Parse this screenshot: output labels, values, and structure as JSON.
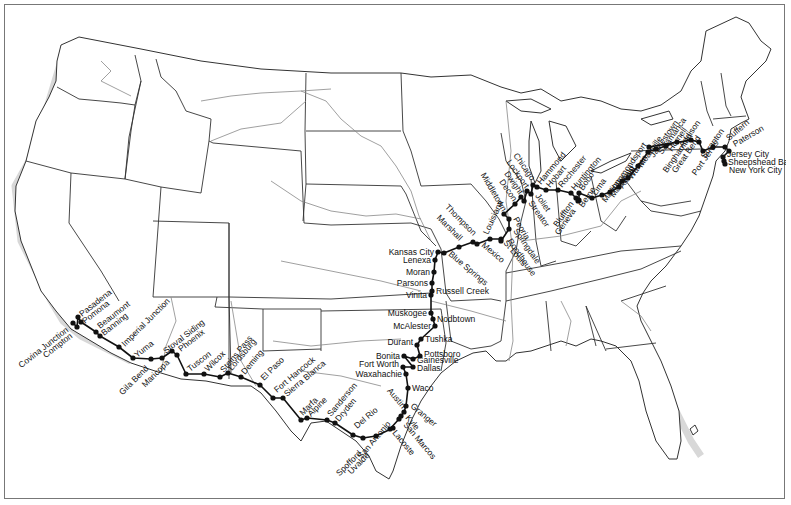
{
  "map": {
    "title": "United States rail route map",
    "colors": {
      "route": "#111111",
      "state_border": "#333333",
      "river": "#888888",
      "frame": "#777777"
    }
  },
  "stations": [
    {
      "name": "Covina Junction",
      "x": 72,
      "y": 322,
      "angle": -38,
      "anchor": "end",
      "dx": -4,
      "dy": 8
    },
    {
      "name": "Compton",
      "x": 76,
      "y": 326,
      "angle": -38,
      "anchor": "end",
      "dx": -4,
      "dy": 10
    },
    {
      "name": "Pasadena",
      "x": 77,
      "y": 316,
      "angle": -38,
      "anchor": "start",
      "dx": 4,
      "dy": 0
    },
    {
      "name": "Pomona",
      "x": 80,
      "y": 321,
      "angle": -38,
      "anchor": "start",
      "dx": 4,
      "dy": 2
    },
    {
      "name": "Beaumont",
      "x": 95,
      "y": 331,
      "angle": -38,
      "anchor": "start",
      "dx": 4,
      "dy": -3
    },
    {
      "name": "Banning",
      "x": 99,
      "y": 335,
      "angle": -38,
      "anchor": "start",
      "dx": 4,
      "dy": 0
    },
    {
      "name": "Imperial Junction",
      "x": 118,
      "y": 346,
      "angle": -45,
      "anchor": "start",
      "dx": 6,
      "dy": 0
    },
    {
      "name": "Yuma",
      "x": 132,
      "y": 357,
      "angle": -38,
      "anchor": "start",
      "dx": 4,
      "dy": 0
    },
    {
      "name": "Gila Bend",
      "x": 150,
      "y": 358,
      "angle": -45,
      "anchor": "end",
      "dx": -2,
      "dy": 10
    },
    {
      "name": "Stoval Siding",
      "x": 161,
      "y": 357,
      "angle": -38,
      "anchor": "start",
      "dx": 4,
      "dy": -4
    },
    {
      "name": "Maricopa",
      "x": 171,
      "y": 350,
      "angle": -45,
      "anchor": "end",
      "dx": -2,
      "dy": 12
    },
    {
      "name": "Phoenix",
      "x": 176,
      "y": 354,
      "angle": -38,
      "anchor": "start",
      "dx": 4,
      "dy": -3
    },
    {
      "name": "Tuscon",
      "x": 185,
      "y": 373,
      "angle": -38,
      "anchor": "start",
      "dx": 4,
      "dy": -2
    },
    {
      "name": "Wilcox",
      "x": 203,
      "y": 373,
      "angle": -45,
      "anchor": "start",
      "dx": 4,
      "dy": -2
    },
    {
      "name": "Steins Pass",
      "x": 219,
      "y": 376,
      "angle": -50,
      "anchor": "start",
      "dx": 4,
      "dy": -4
    },
    {
      "name": "Lordsburg",
      "x": 227,
      "y": 372,
      "angle": -50,
      "anchor": "start",
      "dx": 4,
      "dy": -2
    },
    {
      "name": "Deming",
      "x": 240,
      "y": 376,
      "angle": -50,
      "anchor": "start",
      "dx": 4,
      "dy": -2
    },
    {
      "name": "El Paso",
      "x": 259,
      "y": 384,
      "angle": -45,
      "anchor": "start",
      "dx": 4,
      "dy": -4
    },
    {
      "name": "Fort Hancock",
      "x": 272,
      "y": 397,
      "angle": -40,
      "anchor": "start",
      "dx": 4,
      "dy": -5
    },
    {
      "name": "Sierra Blanca",
      "x": 282,
      "y": 397,
      "angle": -40,
      "anchor": "start",
      "dx": 4,
      "dy": -1
    },
    {
      "name": "Marfa",
      "x": 300,
      "y": 419,
      "angle": -45,
      "anchor": "start",
      "dx": 2,
      "dy": -4
    },
    {
      "name": "Alpine",
      "x": 306,
      "y": 417,
      "angle": -45,
      "anchor": "start",
      "dx": 4,
      "dy": -1
    },
    {
      "name": "Sanderson",
      "x": 326,
      "y": 419,
      "angle": -50,
      "anchor": "start",
      "dx": 4,
      "dy": -3
    },
    {
      "name": "Dryden",
      "x": 334,
      "y": 422,
      "angle": -50,
      "anchor": "start",
      "dx": 4,
      "dy": -1
    },
    {
      "name": "Del Rio",
      "x": 352,
      "y": 434,
      "angle": -40,
      "anchor": "start",
      "dx": 4,
      "dy": -6
    },
    {
      "name": "Spofford",
      "x": 362,
      "y": 437,
      "angle": -45,
      "anchor": "end",
      "dx": -1,
      "dy": 16
    },
    {
      "name": "Uvalde",
      "x": 375,
      "y": 435,
      "angle": -45,
      "anchor": "end",
      "dx": -6,
      "dy": 20
    },
    {
      "name": "San Antonio",
      "x": 392,
      "y": 427,
      "angle": -50,
      "anchor": "end",
      "dx": -2,
      "dy": -4
    },
    {
      "name": "Lacoste",
      "x": 389,
      "y": 428,
      "angle": 50,
      "anchor": "start",
      "dx": 2,
      "dy": 4
    },
    {
      "name": "San Marcos",
      "x": 398,
      "y": 418,
      "angle": 50,
      "anchor": "start",
      "dx": 4,
      "dy": 6
    },
    {
      "name": "Kyle",
      "x": 400,
      "y": 415,
      "angle": 50,
      "anchor": "start",
      "dx": 4,
      "dy": 2
    },
    {
      "name": "Austin",
      "x": 403,
      "y": 411,
      "angle": 50,
      "anchor": "end",
      "dx": -2,
      "dy": -3
    },
    {
      "name": "Granger",
      "x": 405,
      "y": 405,
      "angle": 40,
      "anchor": "start",
      "dx": 4,
      "dy": 1
    },
    {
      "name": "Waco",
      "x": 407,
      "y": 387,
      "angle": 0,
      "anchor": "start",
      "dx": 4,
      "dy": 3
    },
    {
      "name": "Waxahachie",
      "x": 405,
      "y": 373,
      "angle": 0,
      "anchor": "end",
      "dx": -4,
      "dy": 3
    },
    {
      "name": "Fort Worth",
      "x": 402,
      "y": 366,
      "angle": 0,
      "anchor": "end",
      "dx": -4,
      "dy": 0
    },
    {
      "name": "Dallas",
      "x": 412,
      "y": 366,
      "angle": 0,
      "anchor": "start",
      "dx": 4,
      "dy": 4
    },
    {
      "name": "Bonita",
      "x": 403,
      "y": 355,
      "angle": 0,
      "anchor": "end",
      "dx": -4,
      "dy": 3
    },
    {
      "name": "Gainesville",
      "x": 412,
      "y": 358,
      "angle": 0,
      "anchor": "start",
      "dx": 4,
      "dy": 4
    },
    {
      "name": "Pottsboro",
      "x": 419,
      "y": 355,
      "angle": 0,
      "anchor": "start",
      "dx": 4,
      "dy": 1
    },
    {
      "name": "Durant",
      "x": 416,
      "y": 344,
      "angle": 0,
      "anchor": "end",
      "dx": -4,
      "dy": 0
    },
    {
      "name": "Tushka",
      "x": 420,
      "y": 338,
      "angle": 0,
      "anchor": "start",
      "dx": 4,
      "dy": 3
    },
    {
      "name": "McAlester",
      "x": 434,
      "y": 325,
      "angle": 0,
      "anchor": "end",
      "dx": -4,
      "dy": 3
    },
    {
      "name": "Nodbtown",
      "x": 432,
      "y": 318,
      "angle": 0,
      "anchor": "start",
      "dx": 4,
      "dy": 3
    },
    {
      "name": "Muskogee",
      "x": 430,
      "y": 312,
      "angle": 0,
      "anchor": "end",
      "dx": -4,
      "dy": 3
    },
    {
      "name": "Vinita",
      "x": 430,
      "y": 294,
      "angle": 0,
      "anchor": "end",
      "dx": -4,
      "dy": 3
    },
    {
      "name": "Russell Creek",
      "x": 431,
      "y": 290,
      "angle": 0,
      "anchor": "start",
      "dx": 4,
      "dy": 3
    },
    {
      "name": "Parsons",
      "x": 431,
      "y": 282,
      "angle": 0,
      "anchor": "end",
      "dx": -4,
      "dy": 3
    },
    {
      "name": "Moran",
      "x": 433,
      "y": 271,
      "angle": 0,
      "anchor": "end",
      "dx": -4,
      "dy": 3
    },
    {
      "name": "Lenexa",
      "x": 434,
      "y": 259,
      "angle": 0,
      "anchor": "end",
      "dx": -4,
      "dy": 3
    },
    {
      "name": "Kansas City",
      "x": 437,
      "y": 251,
      "angle": 0,
      "anchor": "end",
      "dx": -4,
      "dy": 3
    },
    {
      "name": "Blue Springs",
      "x": 443,
      "y": 252,
      "angle": 40,
      "anchor": "start",
      "dx": 4,
      "dy": 2
    },
    {
      "name": "Marshall",
      "x": 458,
      "y": 246,
      "angle": 45,
      "anchor": "end",
      "dx": 0,
      "dy": -6
    },
    {
      "name": "Thompson",
      "x": 472,
      "y": 241,
      "angle": 45,
      "anchor": "end",
      "dx": 0,
      "dy": -6
    },
    {
      "name": "Mexico",
      "x": 476,
      "y": 243,
      "angle": 40,
      "anchor": "start",
      "dx": 4,
      "dy": 2
    },
    {
      "name": "Louisiana",
      "x": 489,
      "y": 238,
      "angle": -65,
      "anchor": "start",
      "dx": -2,
      "dy": -4
    },
    {
      "name": "St Louis",
      "x": 500,
      "y": 238,
      "angle": 50,
      "anchor": "start",
      "dx": 2,
      "dy": 4
    },
    {
      "name": "Roodhouse",
      "x": 500,
      "y": 240,
      "angle": 55,
      "anchor": "start",
      "dx": 6,
      "dy": 0
    },
    {
      "name": "Springdale",
      "x": 508,
      "y": 228,
      "angle": 55,
      "anchor": "start",
      "dx": 4,
      "dy": 2
    },
    {
      "name": "Peoria",
      "x": 508,
      "y": 218,
      "angle": 60,
      "anchor": "start",
      "dx": 4,
      "dy": 0
    },
    {
      "name": "Middletown",
      "x": 503,
      "y": 213,
      "angle": 60,
      "anchor": "end",
      "dx": -2,
      "dy": -2
    },
    {
      "name": "Decon",
      "x": 514,
      "y": 203,
      "angle": 55,
      "anchor": "end",
      "dx": -2,
      "dy": -2
    },
    {
      "name": "Dwight",
      "x": 520,
      "y": 196,
      "angle": 55,
      "anchor": "end",
      "dx": -2,
      "dy": -2
    },
    {
      "name": "Streator",
      "x": 523,
      "y": 200,
      "angle": 55,
      "anchor": "start",
      "dx": 4,
      "dy": 2
    },
    {
      "name": "Lockport",
      "x": 526,
      "y": 190,
      "angle": 55,
      "anchor": "end",
      "dx": -2,
      "dy": -2
    },
    {
      "name": "Joliet",
      "x": 530,
      "y": 193,
      "angle": 55,
      "anchor": "start",
      "dx": 4,
      "dy": 2
    },
    {
      "name": "Chicago",
      "x": 532,
      "y": 184,
      "angle": 55,
      "anchor": "end",
      "dx": -2,
      "dy": -4
    },
    {
      "name": "Hammond",
      "x": 536,
      "y": 186,
      "angle": -50,
      "anchor": "start",
      "dx": 4,
      "dy": -2
    },
    {
      "name": "Hobart",
      "x": 545,
      "y": 189,
      "angle": -50,
      "anchor": "start",
      "dx": 4,
      "dy": -2
    },
    {
      "name": "Rochester",
      "x": 557,
      "y": 189,
      "angle": -50,
      "anchor": "start",
      "dx": 4,
      "dy": -2
    },
    {
      "name": "Huntington",
      "x": 570,
      "y": 192,
      "angle": -50,
      "anchor": "start",
      "dx": 4,
      "dy": -2
    },
    {
      "name": "Bluffton",
      "x": 575,
      "y": 197,
      "angle": -55,
      "anchor": "end",
      "dx": -2,
      "dy": 6
    },
    {
      "name": "Geneva",
      "x": 577,
      "y": 200,
      "angle": -55,
      "anchor": "end",
      "dx": -2,
      "dy": 10
    },
    {
      "name": "Berne",
      "x": 578,
      "y": 199,
      "angle": -55,
      "anchor": "start",
      "dx": 4,
      "dy": 8
    },
    {
      "name": "Bobo",
      "x": 578,
      "y": 192,
      "angle": -55,
      "anchor": "start",
      "dx": 4,
      "dy": -2
    },
    {
      "name": "Lima",
      "x": 591,
      "y": 197,
      "angle": -55,
      "anchor": "start",
      "dx": 4,
      "dy": -2
    },
    {
      "name": "Marion",
      "x": 601,
      "y": 194,
      "angle": -55,
      "anchor": "start",
      "dx": 4,
      "dy": 8
    },
    {
      "name": "Mansfield",
      "x": 609,
      "y": 191,
      "angle": -55,
      "anchor": "start",
      "dx": 4,
      "dy": 6
    },
    {
      "name": "Akron",
      "x": 618,
      "y": 186,
      "angle": -55,
      "anchor": "start",
      "dx": 4,
      "dy": 2
    },
    {
      "name": "Kent",
      "x": 621,
      "y": 180,
      "angle": -55,
      "anchor": "start",
      "dx": 4,
      "dy": 2
    },
    {
      "name": "Warren",
      "x": 627,
      "y": 177,
      "angle": -55,
      "anchor": "start",
      "dx": 4,
      "dy": 2
    },
    {
      "name": "Meadville",
      "x": 637,
      "y": 165,
      "angle": -55,
      "anchor": "start",
      "dx": 4,
      "dy": 2
    },
    {
      "name": "Jamestown",
      "x": 647,
      "y": 151,
      "angle": -55,
      "anchor": "start",
      "dx": 6,
      "dy": 6
    },
    {
      "name": "Salamanca",
      "x": 655,
      "y": 148,
      "angle": -55,
      "anchor": "start",
      "dx": 6,
      "dy": 6
    },
    {
      "name": "Hornell",
      "x": 665,
      "y": 145,
      "angle": -55,
      "anchor": "start",
      "dx": 6,
      "dy": 6
    },
    {
      "name": "Addison",
      "x": 676,
      "y": 141,
      "angle": -55,
      "anchor": "start",
      "dx": 6,
      "dy": 6
    },
    {
      "name": "Hammondsport",
      "x": 648,
      "y": 146,
      "angle": -55,
      "anchor": "end",
      "dx": -2,
      "dy": -2
    },
    {
      "name": "Binghamton",
      "x": 690,
      "y": 139,
      "angle": -55,
      "anchor": "end",
      "dx": 2,
      "dy": -4
    },
    {
      "name": "Great Bend",
      "x": 698,
      "y": 141,
      "angle": -55,
      "anchor": "end",
      "dx": 2,
      "dy": -4
    },
    {
      "name": "Scranton",
      "x": 702,
      "y": 150,
      "angle": -55,
      "anchor": "start",
      "dx": 2,
      "dy": 8
    },
    {
      "name": "Port Jervis",
      "x": 712,
      "y": 146,
      "angle": -55,
      "anchor": "end",
      "dx": 6,
      "dy": -4
    },
    {
      "name": "Suffern",
      "x": 724,
      "y": 146,
      "angle": -40,
      "anchor": "start",
      "dx": 4,
      "dy": -6
    },
    {
      "name": "Paterson",
      "x": 728,
      "y": 150,
      "angle": -30,
      "anchor": "start",
      "dx": 6,
      "dy": -4
    },
    {
      "name": "Jersey City",
      "x": 722,
      "y": 156,
      "angle": 0,
      "anchor": "start",
      "dx": 4,
      "dy": 0
    },
    {
      "name": "Sheepshead Bay",
      "x": 723,
      "y": 160,
      "angle": 0,
      "anchor": "start",
      "dx": 4,
      "dy": 4
    },
    {
      "name": "New York City",
      "x": 724,
      "y": 163,
      "angle": 0,
      "anchor": "start",
      "dx": 4,
      "dy": 9
    }
  ]
}
